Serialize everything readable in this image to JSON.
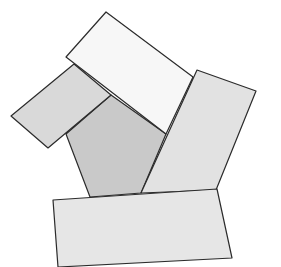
{
  "diagram": {
    "stroke_color": "#2b2b2b",
    "shapes": [
      {
        "id": "pentagon",
        "fill": "#c9c9c9",
        "points": "66,134 111,95 166,134 141,193 90,197"
      },
      {
        "id": "rect-left",
        "fill": "#d9d9d9",
        "points": "11,116 48,148 111,95 74,64"
      },
      {
        "id": "rect-top",
        "fill": "#f7f7f7",
        "points": "66,57 106,12 193,77 166,134"
      },
      {
        "id": "rect-right",
        "fill": "#e2e2e2",
        "points": "197,70 256,91 216,190 141,193"
      },
      {
        "id": "rect-bottom",
        "fill": "#e6e6e6",
        "points": "53,200 217,189 232,258 58,267"
      }
    ]
  }
}
